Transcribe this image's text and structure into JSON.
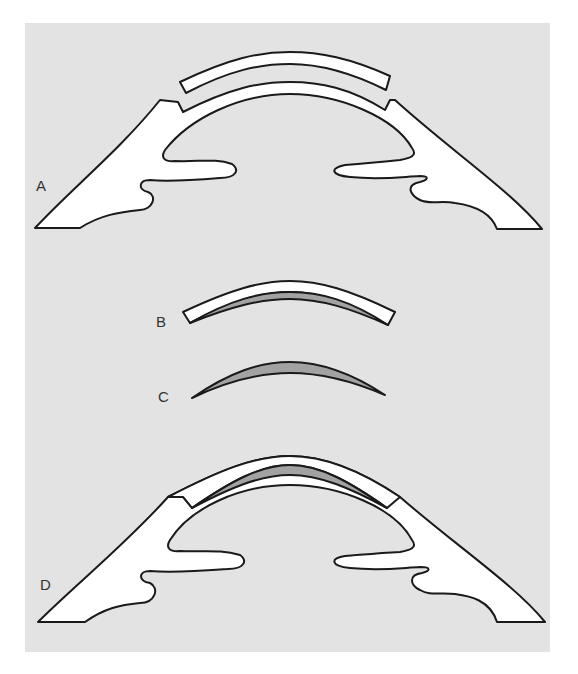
{
  "figure": {
    "panel_background": "#e3e3e3",
    "tissue_fill": "#ffffff",
    "lens_fill": "#a2a2a2",
    "outline": "#1a1a1a",
    "panels": [
      {
        "label": "A",
        "description": "Cornea with separated anterior cap (lamellar flap lifted)"
      },
      {
        "label": "B",
        "description": "Corneal cap with attached lenticule"
      },
      {
        "label": "C",
        "description": "Lenticule alone"
      },
      {
        "label": "D",
        "description": "Cornea with lenticule inlaid beneath cap"
      }
    ]
  }
}
